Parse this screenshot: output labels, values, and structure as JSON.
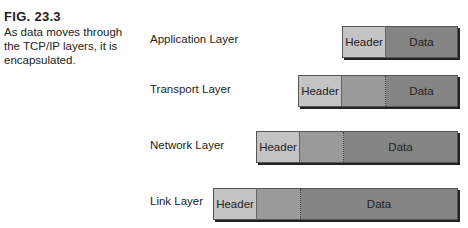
{
  "caption": {
    "figure": "FIG. 23.3",
    "text": "As data moves through the TCP/IP layers, it is encapsulated."
  },
  "layers": [
    {
      "label": "Application Layer",
      "header": "Header",
      "data": "Data"
    },
    {
      "label": "Transport Layer",
      "header": "Header",
      "data": "Data"
    },
    {
      "label": "Network Layer",
      "header": "Header",
      "data": "Data"
    },
    {
      "label": "Link Layer",
      "header": "Header",
      "data": "Data"
    }
  ]
}
